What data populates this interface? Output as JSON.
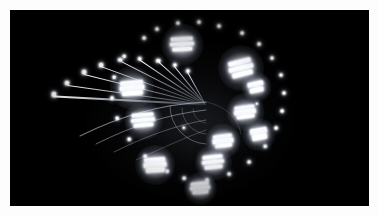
{
  "photo": {
    "subject": "ferris-wheel-night-long-exposure",
    "alt_text": "Long exposure night photograph of an illuminated ferris wheel",
    "background_color": "#000000",
    "frame_color": "#fdfdfd",
    "light_color": "#ffffff",
    "glow_color": "#dfe6f7",
    "width": 379,
    "height": 217,
    "border_width": 10
  },
  "scene": {
    "wheel_center_x": 196,
    "wheel_center_y": 95,
    "wheel_radius": 85,
    "gondola_count": 11,
    "rim_dot_count": 26,
    "trail_count": 9
  },
  "gondolas": [
    {
      "name": "gondola-12",
      "x": 172,
      "y": 34,
      "w": 23,
      "h": 13,
      "glow": 42,
      "bars": 3,
      "rot": -3
    },
    {
      "name": "gondola-1",
      "x": 231,
      "y": 58,
      "w": 24,
      "h": 16,
      "glow": 46,
      "bars": 3,
      "rot": -14
    },
    {
      "name": "gondola-2",
      "x": 235,
      "y": 102,
      "w": 21,
      "h": 12,
      "glow": 38,
      "bars": 3,
      "rot": -8
    },
    {
      "name": "gondola-3",
      "x": 249,
      "y": 124,
      "w": 18,
      "h": 11,
      "glow": 33,
      "bars": 2,
      "rot": -10
    },
    {
      "name": "gondola-4",
      "x": 213,
      "y": 131,
      "w": 20,
      "h": 12,
      "glow": 35,
      "bars": 3,
      "rot": -7
    },
    {
      "name": "gondola-5",
      "x": 203,
      "y": 152,
      "w": 21,
      "h": 13,
      "glow": 37,
      "bars": 3,
      "rot": -6
    },
    {
      "name": "gondola-6",
      "x": 190,
      "y": 178,
      "w": 19,
      "h": 11,
      "glow": 33,
      "bars": 3,
      "rot": -5
    },
    {
      "name": "gondola-7",
      "x": 145,
      "y": 155,
      "w": 22,
      "h": 14,
      "glow": 40,
      "bars": 3,
      "rot": -4
    },
    {
      "name": "gondola-8",
      "x": 133,
      "y": 110,
      "w": 23,
      "h": 13,
      "glow": 39,
      "bars": 3,
      "rot": -5
    },
    {
      "name": "gondola-9",
      "x": 122,
      "y": 78,
      "w": 24,
      "h": 14,
      "glow": 44,
      "bars": 3,
      "rot": -5
    },
    {
      "name": "gondola-10",
      "x": 246,
      "y": 77,
      "w": 17,
      "h": 10,
      "glow": 30,
      "bars": 2,
      "rot": -12
    }
  ],
  "rim_dots": [
    {
      "x": 168,
      "y": 13,
      "r": 1.6
    },
    {
      "x": 189,
      "y": 12,
      "r": 1.5
    },
    {
      "x": 209,
      "y": 16,
      "r": 1.5
    },
    {
      "x": 147,
      "y": 19,
      "r": 1.5
    },
    {
      "x": 134,
      "y": 28,
      "r": 1.4
    },
    {
      "x": 232,
      "y": 23,
      "r": 1.4
    },
    {
      "x": 249,
      "y": 34,
      "r": 1.4
    },
    {
      "x": 262,
      "y": 48,
      "r": 1.5
    },
    {
      "x": 114,
      "y": 46,
      "r": 1.3
    },
    {
      "x": 271,
      "y": 65,
      "r": 1.5
    },
    {
      "x": 274,
      "y": 83,
      "r": 1.5
    },
    {
      "x": 272,
      "y": 101,
      "r": 1.4
    },
    {
      "x": 104,
      "y": 67,
      "r": 1.3
    },
    {
      "x": 102,
      "y": 88,
      "r": 1.4
    },
    {
      "x": 107,
      "y": 108,
      "r": 1.3
    },
    {
      "x": 266,
      "y": 118,
      "r": 1.4
    },
    {
      "x": 255,
      "y": 136,
      "r": 1.3
    },
    {
      "x": 239,
      "y": 152,
      "r": 1.4
    },
    {
      "x": 119,
      "y": 129,
      "r": 1.3
    },
    {
      "x": 135,
      "y": 146,
      "r": 1.3
    },
    {
      "x": 219,
      "y": 164,
      "r": 1.4
    },
    {
      "x": 197,
      "y": 170,
      "r": 1.4
    },
    {
      "x": 174,
      "y": 168,
      "r": 1.3
    },
    {
      "x": 157,
      "y": 161,
      "r": 1.3
    },
    {
      "x": 174,
      "y": 118,
      "r": 1.2
    },
    {
      "x": 247,
      "y": 94,
      "r": 1.2
    }
  ],
  "trails": [
    {
      "name": "trail-1",
      "x": 196,
      "y": 95,
      "angle": 183,
      "len": 152,
      "thick": 1.5,
      "bow": -22
    },
    {
      "name": "trail-2",
      "x": 196,
      "y": 95,
      "angle": 188,
      "len": 140,
      "thick": 1.4,
      "bow": -20
    },
    {
      "name": "trail-3",
      "x": 196,
      "y": 95,
      "angle": 194,
      "len": 126,
      "thick": 1.3,
      "bow": -18
    },
    {
      "name": "trail-4",
      "x": 196,
      "y": 95,
      "angle": 200,
      "len": 112,
      "thick": 1.3,
      "bow": -16
    },
    {
      "name": "trail-5",
      "x": 196,
      "y": 95,
      "angle": 207,
      "len": 96,
      "thick": 1.2,
      "bow": -14
    },
    {
      "name": "trail-6",
      "x": 196,
      "y": 95,
      "angle": 214,
      "len": 80,
      "thick": 1.2,
      "bow": -12
    },
    {
      "name": "trail-7",
      "x": 196,
      "y": 95,
      "angle": 222,
      "len": 64,
      "thick": 1.1,
      "bow": -10
    },
    {
      "name": "trail-8",
      "x": 196,
      "y": 95,
      "angle": 231,
      "len": 50,
      "thick": 1.0,
      "bow": -8
    },
    {
      "name": "trail-9",
      "x": 196,
      "y": 95,
      "angle": 241,
      "len": 38,
      "thick": 1.0,
      "bow": -6
    }
  ],
  "arcs": [
    {
      "name": "arc-outer",
      "d": "M 70 126 C 110 106 152 94 196 92",
      "opacity": 0.55,
      "width": 1.1
    },
    {
      "name": "arc-second",
      "d": "M 86 134 C 122 116 158 104 196 100",
      "opacity": 0.42,
      "width": 1.0
    },
    {
      "name": "arc-third",
      "d": "M 104 142 C 134 127 166 115 196 110",
      "opacity": 0.34,
      "width": 0.9
    },
    {
      "name": "arc-inner",
      "d": "M 126 150 C 150 139 174 128 196 120",
      "opacity": 0.26,
      "width": 0.9
    },
    {
      "name": "arc-hub-1",
      "d": "M 160 96 A 38 38 0 0 0 196 134",
      "opacity": 0.38,
      "width": 0.9
    },
    {
      "name": "arc-hub-2",
      "d": "M 172 98 A 26 26 0 0 0 196 124",
      "opacity": 0.3,
      "width": 0.8
    },
    {
      "name": "arc-hub-3",
      "d": "M 183 99 A 14 14 0 0 0 196 113",
      "opacity": 0.24,
      "width": 0.8
    },
    {
      "name": "arc-sweep",
      "d": "M 196 92 C 216 96 228 108 231 124",
      "opacity": 0.2,
      "width": 0.8
    }
  ]
}
